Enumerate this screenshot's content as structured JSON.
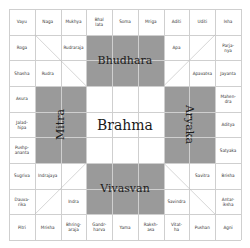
{
  "grid": {
    "rows": 9,
    "cols": 9
  },
  "colors": {
    "shade": "#9a9a9a",
    "line": "#cfcfcf",
    "background": "#ffffff",
    "text": "#333333"
  },
  "outer_ring": {
    "top": [
      "Vayu",
      "Naga",
      "Mukhya",
      "Bhal\nlata",
      "Soma",
      "Mrigа",
      "Aditi",
      "Uditi",
      "Isha"
    ],
    "right": [
      "Parja-\nnya",
      "Jayanta",
      "Mahen-\ndra",
      "Aditya",
      "Satyaka",
      "Brisha",
      "Antar-\niksha"
    ],
    "bottom": [
      "Pitri",
      "Mrisha",
      "Bhring-\naraja",
      "Gandr-\nharva",
      "Yama",
      "Raksh-\nasa",
      "Vitat-\nha",
      "Pushan",
      "Agni"
    ],
    "left": [
      "Roga",
      "Shasha",
      "Asura",
      "Jalad-\nhipa",
      "Pushp-\nananta",
      "Sugriva",
      "Dauva-\nrika"
    ]
  },
  "inner_labels": {
    "rudraraja": "Rudraraja",
    "rudra": "Rudra",
    "apa": "Apa",
    "apavatsa": "Apavatsa",
    "indrajaya": "Indrajaya",
    "indra": "Indra",
    "savitra": "Savitra",
    "savindra": "Savindra"
  },
  "main_deities": {
    "north": "Bhudhara",
    "west": "Mitra",
    "east": "Aryaka",
    "south": "Vivasvan",
    "center": "Brahma"
  }
}
